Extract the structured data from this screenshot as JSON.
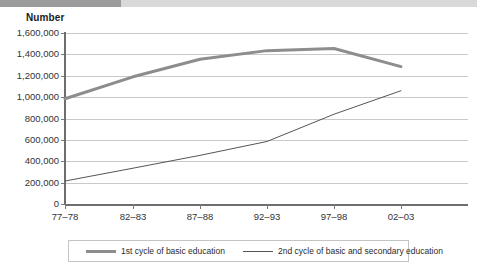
{
  "header": {
    "axis_title": "Number"
  },
  "chart_data": {
    "type": "line",
    "title": "",
    "subtitle": "",
    "xlabel": "",
    "ylabel": "Number",
    "categories": [
      "77–78",
      "82–83",
      "87–88",
      "92–93",
      "97–98",
      "02–03"
    ],
    "ylim": [
      0,
      1600000
    ],
    "ytick_values": [
      0,
      200000,
      400000,
      600000,
      800000,
      1000000,
      1200000,
      1400000,
      1600000
    ],
    "ytick_labels": [
      "0",
      "200,000",
      "400,000",
      "600,000",
      "800,000",
      "1,000,000",
      "1,200,000",
      "1,400,000",
      "1,600,000"
    ],
    "grid": true,
    "legend_position": "bottom",
    "series": [
      {
        "name": "1st cycle of basic education",
        "color": "#8d8d8d",
        "width": 3,
        "values": [
          985000,
          1190000,
          1355000,
          1435000,
          1455000,
          1285000
        ]
      },
      {
        "name": "2nd cycle of basic and secondary education",
        "color": "#555555",
        "width": 1,
        "values": [
          215000,
          335000,
          455000,
          585000,
          840000,
          1060000
        ]
      }
    ]
  },
  "legend": {
    "items": [
      {
        "label": "1st cycle of basic education"
      },
      {
        "label": "2nd cycle of basic and secondary education"
      }
    ]
  },
  "colors": {
    "series_1": "#8d8d8d",
    "series_2": "#555555",
    "grid": "#c9c9c9",
    "axis": "#6e6e6e",
    "banner_dark": "#9b9b9b",
    "banner_light": "#d9d9d9"
  }
}
